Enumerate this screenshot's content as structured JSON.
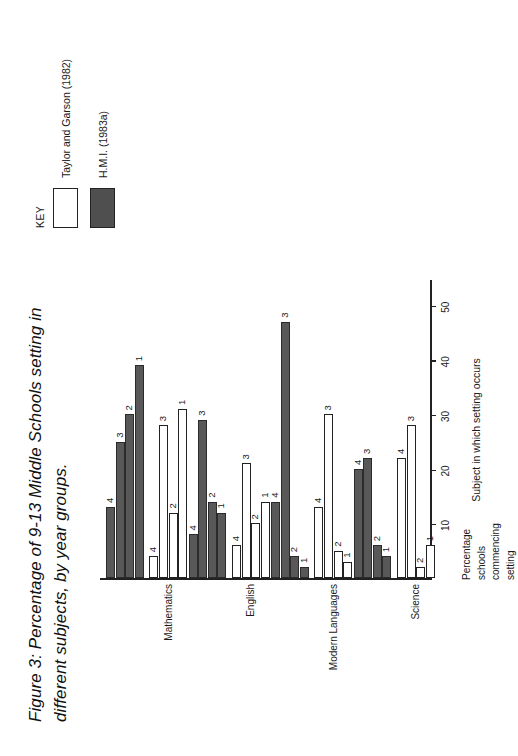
{
  "figure": {
    "title_line1": "Figure 3: Percentage of 9-13 Middle Schools setting in",
    "title_line2": "different subjects, by year groups."
  },
  "legend": {
    "key_title": "KEY",
    "items": [
      {
        "label": "Taylor and Garson (1982)",
        "style": "light",
        "color": "#ffffff"
      },
      {
        "label": "H.M.I. (1983a)",
        "style": "dark",
        "color": "#585858"
      }
    ]
  },
  "axes": {
    "value_axis_title_lines": [
      "Percentage",
      "schools",
      "commencing",
      "setting"
    ],
    "category_axis_title": "Subject in which setting occurs",
    "ticks": [
      10,
      20,
      30,
      40,
      50
    ]
  },
  "chart_data": {
    "type": "bar",
    "title": "Figure 3: Percentage of 9-13 Middle Schools setting in different subjects, by year groups.",
    "xlabel": "Subject in which setting occurs",
    "ylabel": "Percentage schools commencing setting",
    "ylim": [
      0,
      55
    ],
    "grid": false,
    "legend_position": "top-right",
    "orientation": "horizontal-bars-rotated",
    "categories": [
      "Mathematics",
      "English",
      "Modern Languages",
      "Science"
    ],
    "group_labels": [
      "1",
      "2",
      "3",
      "4"
    ],
    "series": [
      {
        "name": "Taylor and Garson (1982)",
        "color": "#ffffff",
        "groups": [
          {
            "category": "Mathematics",
            "values": [
              31,
              12,
              28,
              4
            ]
          },
          {
            "category": "English",
            "values": [
              14,
              10,
              21,
              6
            ]
          },
          {
            "category": "Modern Languages",
            "values": [
              3,
              5,
              30,
              13
            ]
          },
          {
            "category": "Science",
            "values": [
              6,
              2,
              28,
              22
            ]
          }
        ]
      },
      {
        "name": "H.M.I. (1983a)",
        "color": "#585858",
        "groups": [
          {
            "category": "Mathematics",
            "values": [
              39,
              30,
              25,
              13
            ]
          },
          {
            "category": "English",
            "values": [
              12,
              14,
              29,
              8
            ]
          },
          {
            "category": "Modern Languages",
            "values": [
              2,
              4,
              47,
              14
            ]
          },
          {
            "category": "Science",
            "values": [
              4,
              6,
              22,
              20
            ]
          }
        ]
      }
    ]
  }
}
